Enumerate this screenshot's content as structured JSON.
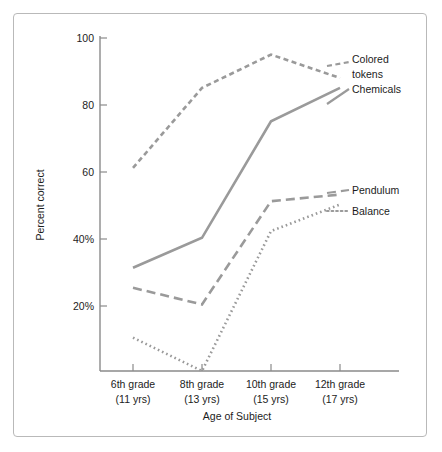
{
  "chart_data": {
    "type": "line",
    "title": "",
    "xlabel": "Age of Subject",
    "ylabel": "Percent correct",
    "categories": [
      "6th grade\n(11 yrs)",
      "8th grade\n(13 yrs)",
      "10th grade\n(15 yrs)",
      "12th grade\n(17 yrs)"
    ],
    "category_lines": [
      {
        "grade": "6th grade",
        "age": "(11 yrs)"
      },
      {
        "grade": "8th grade",
        "age": "(13 yrs)"
      },
      {
        "grade": "10th grade",
        "age": "(15 yrs)"
      },
      {
        "grade": "12th grade",
        "age": "(17 yrs)"
      }
    ],
    "ylim": [
      0,
      100
    ],
    "xlim_categories": 4,
    "grid": false,
    "legend_position": "right-inline-labels",
    "yticks": [
      {
        "value": 20,
        "label": "20%"
      },
      {
        "value": 40,
        "label": "40%"
      },
      {
        "value": 60,
        "label": "60"
      },
      {
        "value": 80,
        "label": "80"
      },
      {
        "value": 100,
        "label": "100"
      }
    ],
    "series": [
      {
        "name": "Colored tokens",
        "label": "Colored tokens",
        "label_line1": "Colored",
        "label_line2": "tokens",
        "style": "short-dashed",
        "dasharray": "5,3.5",
        "color": "#9a9a9a",
        "values": [
          61,
          85,
          95,
          88
        ]
      },
      {
        "name": "Chemicals",
        "label": "Chemicals",
        "style": "solid",
        "dasharray": "none",
        "color": "#9a9a9a",
        "values": [
          31,
          40,
          75,
          85
        ]
      },
      {
        "name": "Pendulum",
        "label": "Pendulum",
        "style": "long-dashed",
        "dasharray": "9,5",
        "color": "#9a9a9a",
        "values": [
          25,
          20,
          51,
          53
        ]
      },
      {
        "name": "Balance",
        "label": "Balance",
        "style": "dotted",
        "dasharray": "1.6,3",
        "color": "#9a9a9a",
        "values": [
          10,
          0,
          42,
          50
        ]
      }
    ]
  },
  "colors": {
    "frame": "#b9b9b9",
    "axis": "#8a8a8a",
    "line": "#9a9a9a",
    "text": "#1c1c1c",
    "background": "#ffffff"
  }
}
